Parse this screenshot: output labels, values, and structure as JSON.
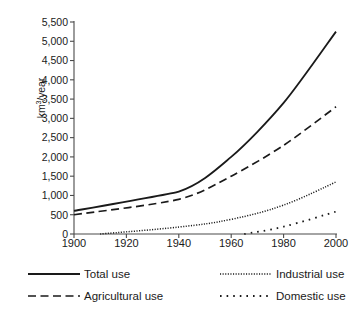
{
  "chart_data": {
    "type": "line",
    "title": "",
    "xlabel": "",
    "ylabel": "km3/year",
    "ylabel_display": "km",
    "ylabel_sup": "3",
    "ylabel_tail": "/year",
    "xlim": [
      1900,
      2000
    ],
    "ylim": [
      0,
      5500
    ],
    "grid": false,
    "legend_position": "below",
    "x_ticks": [
      1900,
      1920,
      1940,
      1960,
      1980,
      2000
    ],
    "x_tick_labels": [
      "1900",
      "1920",
      "1940",
      "1960",
      "1980",
      "2000"
    ],
    "y_ticks": [
      0,
      500,
      1000,
      1500,
      2000,
      2500,
      3000,
      3500,
      4000,
      4500,
      5000,
      5500
    ],
    "y_tick_labels": [
      "0",
      "500",
      "1,000",
      "1,500",
      "2,000",
      "2,500",
      "3,000",
      "3,500",
      "4,000",
      "4,500",
      "5,000",
      "5,500"
    ],
    "series": [
      {
        "name": "Total use",
        "style": "solid",
        "color": "#1a1a1a",
        "x": [
          1900,
          1940,
          1960,
          1980,
          2000
        ],
        "values": [
          600,
          1100,
          2000,
          3400,
          5250
        ]
      },
      {
        "name": "Agricultural use",
        "style": "dashed",
        "color": "#1a1a1a",
        "x": [
          1900,
          1940,
          1960,
          1980,
          2000
        ],
        "values": [
          500,
          900,
          1500,
          2300,
          3300
        ]
      },
      {
        "name": "Industrial use",
        "style": "fine-dotted",
        "color": "#1a1a1a",
        "x": [
          1910,
          1940,
          1960,
          1980,
          2000
        ],
        "values": [
          0,
          180,
          380,
          750,
          1350
        ]
      },
      {
        "name": "Domestic use",
        "style": "sparse-dotted",
        "color": "#1a1a1a",
        "x": [
          1965,
          1980,
          2000
        ],
        "values": [
          0,
          190,
          580
        ]
      }
    ]
  },
  "legend": {
    "entries": [
      {
        "label": "Total use",
        "style": "solid"
      },
      {
        "label": "Industrial use",
        "style": "fine-dotted"
      },
      {
        "label": "Agricultural use",
        "style": "dashed"
      },
      {
        "label": "Domestic use",
        "style": "sparse-dotted"
      }
    ]
  },
  "colors": {
    "line": "#1a1a1a",
    "axis": "#4a4a4a",
    "background": "#ffffff"
  }
}
